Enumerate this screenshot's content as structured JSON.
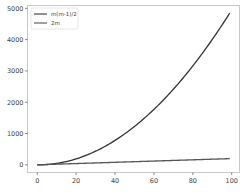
{
  "chart_data": {
    "type": "line",
    "title": "",
    "xlabel": "",
    "ylabel": "",
    "xlim": [
      -5,
      104
    ],
    "ylim": [
      -245,
      5090
    ],
    "x_ticks": [
      0,
      20,
      40,
      60,
      80,
      100
    ],
    "y_ticks": [
      0,
      1000,
      2000,
      3000,
      4000,
      5000
    ],
    "x_tick_labels": [
      "0",
      "20",
      "40",
      "60",
      "80",
      "100"
    ],
    "y_tick_labels": [
      "0",
      "1000",
      "2000",
      "3000",
      "4000",
      "5000"
    ],
    "grid": false,
    "legend_position": "upper left",
    "x_range": [
      0,
      99
    ],
    "series": [
      {
        "name": "m(m-1)/2",
        "formula": "m*(m-1)/2",
        "color": "#333333",
        "end_value": 4851
      },
      {
        "name": "2m",
        "formula": "2*m",
        "color": "#555555",
        "end_value": 198
      }
    ]
  },
  "legend": {
    "items": [
      {
        "label": "m(m-1)/2",
        "color": "#333333"
      },
      {
        "label": "2m",
        "color": "#555555"
      }
    ]
  }
}
